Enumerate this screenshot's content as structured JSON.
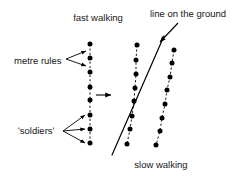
{
  "figure": {
    "title_text": "",
    "background_color": "#ffffff",
    "ink_color": "#000000",
    "width": 243,
    "height": 176
  },
  "labels": {
    "fast_walking": "fast walking",
    "line_on_the_ground": "line on the ground",
    "metre_rules": "metre rules",
    "soldiers": "'soldiers'",
    "slow_walking": "slow walking"
  },
  "chart_data": {
    "type": "scatter",
    "title": "",
    "xlabel": "",
    "ylabel": "",
    "grid": false,
    "legend": "none",
    "annotations": [
      {
        "name": "fast-walking",
        "text": "fast walking",
        "x": 98,
        "y": 18
      },
      {
        "name": "line-on-the-ground",
        "text": "line on the ground",
        "x": 188,
        "y": 14
      },
      {
        "name": "metre-rules",
        "text": "metre rules",
        "x": 32,
        "y": 61
      },
      {
        "name": "soldiers",
        "text": "'soldiers'",
        "x": 30,
        "y": 131
      },
      {
        "name": "slow-walking",
        "text": "slow walking",
        "x": 161,
        "y": 165
      }
    ],
    "series": [
      {
        "name": "column-left-fast-walking",
        "marker": "filled-circle",
        "connector": "dashed",
        "points": [
          {
            "x": 90,
            "y": 44
          },
          {
            "x": 90,
            "y": 58
          },
          {
            "x": 90,
            "y": 72
          },
          {
            "x": 90,
            "y": 87
          },
          {
            "x": 90,
            "y": 100
          },
          {
            "x": 90,
            "y": 115
          },
          {
            "x": 90,
            "y": 129
          },
          {
            "x": 90,
            "y": 143
          }
        ]
      },
      {
        "name": "column-middle",
        "marker": "filled-circle",
        "connector": "dashed",
        "points": [
          {
            "x": 137,
            "y": 45
          },
          {
            "x": 136,
            "y": 60
          },
          {
            "x": 136,
            "y": 74
          },
          {
            "x": 135,
            "y": 88
          },
          {
            "x": 134,
            "y": 101
          },
          {
            "x": 132,
            "y": 116
          },
          {
            "x": 130,
            "y": 129
          },
          {
            "x": 127,
            "y": 144
          }
        ]
      },
      {
        "name": "column-right-slow-walking",
        "marker": "filled-circle",
        "connector": "dashed",
        "points": [
          {
            "x": 174,
            "y": 50
          },
          {
            "x": 172,
            "y": 63
          },
          {
            "x": 170,
            "y": 77
          },
          {
            "x": 167,
            "y": 90
          },
          {
            "x": 165,
            "y": 104
          },
          {
            "x": 162,
            "y": 118
          },
          {
            "x": 160,
            "y": 131
          },
          {
            "x": 156,
            "y": 145
          }
        ]
      }
    ],
    "lines": [
      {
        "name": "ground-line",
        "style": "solid",
        "from": {
          "x": 164,
          "y": 36
        },
        "to": {
          "x": 112,
          "y": 155
        }
      }
    ],
    "arrows": [
      {
        "name": "motion-direction-arrow",
        "from": {
          "x": 96,
          "y": 95
        },
        "to": {
          "x": 111,
          "y": 95
        },
        "direction": "right"
      },
      {
        "name": "ground-line-pointer-arrow",
        "from": {
          "x": 178,
          "y": 23
        },
        "to": {
          "x": 160,
          "y": 42
        },
        "direction": "down-left"
      },
      {
        "name": "metre-rules-leader-upper",
        "from": {
          "x": 66,
          "y": 59
        },
        "to": {
          "x": 86,
          "y": 51
        }
      },
      {
        "name": "metre-rules-leader-lower",
        "from": {
          "x": 66,
          "y": 59
        },
        "to": {
          "x": 86,
          "y": 66
        }
      },
      {
        "name": "soldiers-leader-upper",
        "from": {
          "x": 63,
          "y": 131
        },
        "to": {
          "x": 85,
          "y": 115
        }
      },
      {
        "name": "soldiers-leader-middle",
        "from": {
          "x": 63,
          "y": 131
        },
        "to": {
          "x": 85,
          "y": 129
        }
      },
      {
        "name": "soldiers-leader-lower",
        "from": {
          "x": 63,
          "y": 131
        },
        "to": {
          "x": 85,
          "y": 143
        }
      }
    ]
  }
}
